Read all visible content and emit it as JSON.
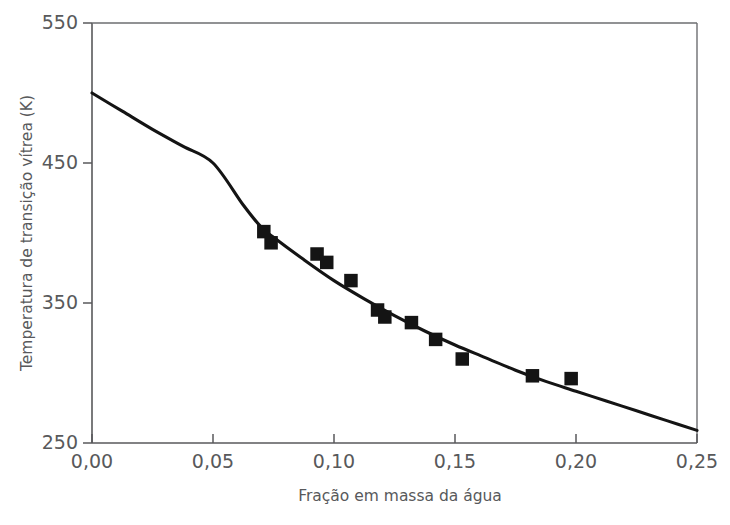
{
  "chart_data": {
    "type": "scatter",
    "title": "",
    "xlabel": "Fração em massa da água",
    "ylabel": "Temperatura de transição vítrea (K)",
    "xlim": [
      0.0,
      0.25
    ],
    "ylim": [
      250,
      550
    ],
    "xticks": [
      0.0,
      0.05,
      0.1,
      0.15,
      0.2,
      0.25
    ],
    "xtick_labels": [
      "0,00",
      "0,05",
      "0,10",
      "0,15",
      "0,20",
      "0,25"
    ],
    "yticks": [
      250,
      350,
      450,
      550
    ],
    "ytick_labels": [
      "250",
      "350",
      "450",
      "550"
    ],
    "grid": false,
    "legend": "none",
    "series": [
      {
        "name": "Dados experimentais",
        "kind": "scatter",
        "marker": "square",
        "marker_color": "#141414",
        "points": [
          {
            "x": 0.071,
            "y": 401
          },
          {
            "x": 0.074,
            "y": 393
          },
          {
            "x": 0.093,
            "y": 385
          },
          {
            "x": 0.097,
            "y": 379
          },
          {
            "x": 0.107,
            "y": 366
          },
          {
            "x": 0.118,
            "y": 345
          },
          {
            "x": 0.121,
            "y": 340
          },
          {
            "x": 0.132,
            "y": 336
          },
          {
            "x": 0.142,
            "y": 324
          },
          {
            "x": 0.153,
            "y": 310
          },
          {
            "x": 0.182,
            "y": 298
          },
          {
            "x": 0.198,
            "y": 296
          }
        ]
      },
      {
        "name": "Curva ajustada",
        "kind": "line",
        "line_color": "#141414",
        "points": [
          {
            "x": 0.0,
            "y": 500
          },
          {
            "x": 0.0125,
            "y": 487
          },
          {
            "x": 0.025,
            "y": 474
          },
          {
            "x": 0.0375,
            "y": 462
          },
          {
            "x": 0.05,
            "y": 450
          },
          {
            "x": 0.0625,
            "y": 420
          },
          {
            "x": 0.07,
            "y": 404
          },
          {
            "x": 0.075,
            "y": 397
          },
          {
            "x": 0.0875,
            "y": 381
          },
          {
            "x": 0.1,
            "y": 366
          },
          {
            "x": 0.1125,
            "y": 353
          },
          {
            "x": 0.125,
            "y": 341
          },
          {
            "x": 0.1375,
            "y": 330
          },
          {
            "x": 0.15,
            "y": 320
          },
          {
            "x": 0.1625,
            "y": 311
          },
          {
            "x": 0.175,
            "y": 302
          },
          {
            "x": 0.1875,
            "y": 294
          },
          {
            "x": 0.2,
            "y": 287
          },
          {
            "x": 0.2125,
            "y": 280
          },
          {
            "x": 0.225,
            "y": 273
          },
          {
            "x": 0.2375,
            "y": 266
          },
          {
            "x": 0.25,
            "y": 259
          }
        ]
      }
    ]
  },
  "axes": {
    "y_axis_title": "Temperatura de transição vítrea (K)",
    "x_axis_title": "Fração em massa da água",
    "y_labels": [
      "550",
      "450",
      "350",
      "250"
    ],
    "x_labels": [
      "0,00",
      "0,05",
      "0,10",
      "0,15",
      "0,20",
      "0,25"
    ]
  },
  "colors": {
    "ink": "#141414",
    "axis": "#58595b",
    "frame": "#6d6e71",
    "background": "#ffffff"
  }
}
